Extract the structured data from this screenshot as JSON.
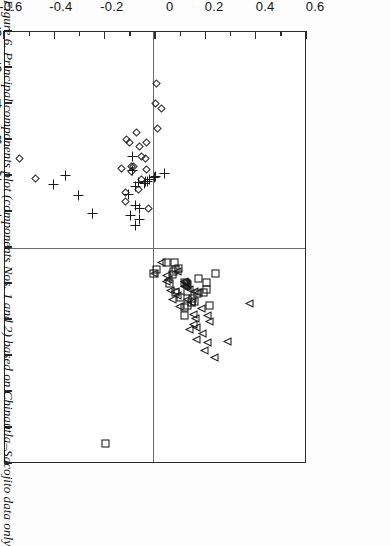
{
  "figure": {
    "caption": "Figure 6. Principal components plot (components Nos. 1 and 2) based on Chinautla–Sacojito data only.",
    "orientation": "rotated-90-clockwise"
  },
  "chart_data": {
    "type": "scatter",
    "title": "",
    "xlabel": "PRINCIPAL COMPONENT #2",
    "ylabel": "PRINCIPAL COMPONENT #1",
    "xlim": [
      -0.6,
      0.6
    ],
    "ylim": [
      -0.6,
      0.6
    ],
    "grid": false,
    "zero_lines": true,
    "legend_position": "below-axis",
    "xticks": [
      -0.6,
      -0.4,
      -0.2,
      0,
      0.2,
      0.4,
      0.6
    ],
    "xticklabels": [
      "-0.6",
      "-0.4",
      "-0.2",
      "0",
      "0.2",
      "0.4",
      "0.6"
    ],
    "xminorticks": [
      -0.5,
      -0.3,
      -0.1,
      0.1,
      0.3,
      0.5
    ],
    "yticks": [
      -0.6,
      -0.5,
      -0.4,
      -0.3,
      -0.2,
      -0.1,
      0,
      0.1,
      0.2,
      0.3,
      0.4,
      0.5,
      0.6
    ],
    "yticklabels": [
      "-0.6",
      "-0.5",
      "-0.4",
      "-0.3",
      "-0.2",
      "-0.1",
      "0",
      "0.1",
      "0.2",
      "0.3",
      "0.4",
      "0.5",
      "0.6"
    ],
    "series": [
      {
        "name": "'Medium Paste'",
        "marker": "square",
        "color": "#1a1a1a",
        "points": [
          [
            0.146,
            0.152
          ],
          [
            0.133,
            0.16
          ],
          [
            0.16,
            0.15
          ],
          [
            0.152,
            0.143
          ],
          [
            0.118,
            0.166
          ],
          [
            0.196,
            0.124
          ],
          [
            0.205,
            0.118
          ],
          [
            0.17,
            0.128
          ],
          [
            0.133,
            0.121
          ],
          [
            0.208,
            0.097
          ],
          [
            0.176,
            0.085
          ],
          [
            0.103,
            0.138
          ],
          [
            0.22,
            0.16
          ],
          [
            0.128,
            0.1
          ],
          [
            0.085,
            0.124
          ],
          [
            0.07,
            0.075
          ],
          [
            0.074,
            0.066
          ],
          [
            0.082,
            0.061
          ],
          [
            0.06,
            0.1
          ],
          [
            0.241,
            0.073
          ],
          [
            0.078,
            0.043
          ],
          [
            0.047,
            0.041
          ],
          [
            0.118,
            0.19
          ],
          [
            0.095,
            0.058
          ],
          [
            0.009,
            0.06
          ],
          [
            0.118,
            0.096
          ],
          [
            -0.196,
            0.545
          ],
          [
            -0.005,
            0.073
          ]
        ]
      },
      {
        "name": "'Fine Paste'",
        "marker": "plus",
        "color": "#1a1a1a",
        "points": [
          [
            0.04,
            -0.208
          ],
          [
            0.005,
            -0.2
          ],
          [
            0.003,
            -0.196
          ],
          [
            -0.016,
            -0.19
          ],
          [
            -0.025,
            -0.186
          ],
          [
            -0.032,
            -0.186
          ],
          [
            -0.038,
            -0.18
          ],
          [
            -0.06,
            -0.181
          ],
          [
            -0.072,
            -0.172
          ],
          [
            -0.084,
            -0.214
          ],
          [
            -0.084,
            -0.254
          ],
          [
            -0.103,
            -0.148
          ],
          [
            -0.094,
            -0.09
          ],
          [
            -0.072,
            -0.118
          ],
          [
            -0.056,
            -0.11
          ],
          [
            -0.056,
            -0.078
          ],
          [
            -0.245,
            -0.095
          ],
          [
            -0.3,
            -0.146
          ],
          [
            -0.352,
            -0.202
          ],
          [
            -0.4,
            -0.177
          ],
          [
            -0.072,
            -0.063
          ]
        ]
      },
      {
        "name": "Raw Clay",
        "marker": "diamond",
        "color": "#1a1a1a",
        "points": [
          [
            0.005,
            -0.4
          ],
          [
            -0.115,
            -0.128
          ],
          [
            -0.115,
            -0.153
          ],
          [
            -0.052,
            -0.254
          ],
          [
            -0.06,
            -0.28
          ],
          [
            -0.1,
            -0.292
          ],
          [
            -0.09,
            -0.212
          ],
          [
            -0.09,
            -0.224
          ],
          [
            -0.085,
            -0.226
          ],
          [
            -0.063,
            -0.16
          ],
          [
            -0.132,
            -0.219
          ],
          [
            -0.11,
            -0.3
          ],
          [
            -0.072,
            -0.32
          ],
          [
            -0.052,
            -0.19
          ],
          [
            -0.035,
            -0.248
          ],
          [
            -0.032,
            -0.216
          ],
          [
            -0.03,
            -0.291
          ],
          [
            -0.471,
            -0.192
          ],
          [
            -0.538,
            -0.248
          ],
          [
            0.012,
            -0.33
          ],
          [
            0.006,
            -0.455
          ],
          [
            0.028,
            -0.385
          ],
          [
            -0.022,
            -0.108
          ]
        ]
      },
      {
        "name": "Sherds",
        "marker": "triangle-left",
        "color": "#1a1a1a",
        "points": [
          [
            0.29,
            0.262
          ],
          [
            0.377,
            0.155
          ],
          [
            0.218,
            0.205
          ],
          [
            0.21,
            0.19
          ],
          [
            0.19,
            0.238
          ],
          [
            0.188,
            0.17
          ],
          [
            0.176,
            0.125
          ],
          [
            0.166,
            0.221
          ],
          [
            0.162,
            0.196
          ],
          [
            0.16,
            0.121
          ],
          [
            0.155,
            0.213
          ],
          [
            0.155,
            0.186
          ],
          [
            0.148,
            0.153
          ],
          [
            0.141,
            0.228
          ],
          [
            0.14,
            0.118
          ],
          [
            0.133,
            0.145
          ],
          [
            0.133,
            0.104
          ],
          [
            0.128,
            0.1
          ],
          [
            0.126,
            0.108
          ],
          [
            0.124,
            0.097
          ],
          [
            0.12,
            0.094
          ],
          [
            0.118,
            0.107
          ],
          [
            0.238,
            0.305
          ],
          [
            0.21,
            0.265
          ],
          [
            0.098,
            0.165
          ],
          [
            0.092,
            0.133
          ],
          [
            0.09,
            0.068
          ],
          [
            0.083,
            0.121
          ],
          [
            0.072,
            0.145
          ],
          [
            0.062,
            0.12
          ],
          [
            0.055,
            0.088
          ],
          [
            0.047,
            0.095
          ],
          [
            0.046,
            0.077
          ],
          [
            0.028,
            0.043
          ],
          [
            0.0,
            0.073
          ],
          [
            0.166,
            0.256
          ],
          [
            0.2,
            0.285
          ]
        ]
      }
    ]
  }
}
